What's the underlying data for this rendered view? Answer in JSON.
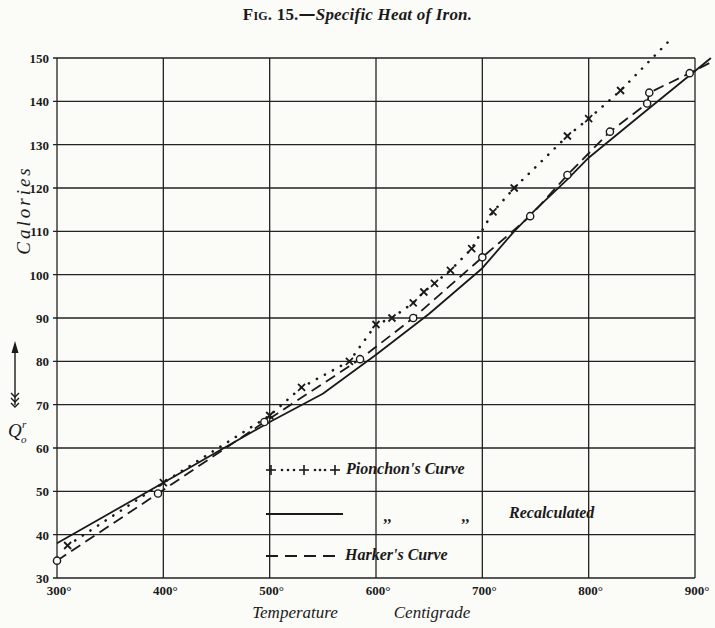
{
  "figure": {
    "label": "Fig. 15.",
    "caption": "Specific Heat of Iron.",
    "dash": "—"
  },
  "axes": {
    "y_label": "Calories",
    "y_symbol": "Q",
    "y_symbol_sub": "o",
    "y_symbol_sup": "r",
    "x_label_1": "Temperature",
    "x_label_2": "Centigrade",
    "x_ticks": [
      "300°",
      "400°",
      "500°",
      "600°",
      "700°",
      "800°",
      "900°"
    ],
    "y_ticks": [
      "30",
      "40",
      "50",
      "60",
      "70",
      "80",
      "90",
      "100",
      "110",
      "120",
      "130",
      "140",
      "150"
    ]
  },
  "legend": {
    "pionchon": "Pionchon's Curve",
    "ditto_1": ",,",
    "ditto_2": ",,",
    "recalculated": "Recalculated",
    "harker": "Harker's Curve"
  },
  "colors": {
    "ink": "#1a1a1a",
    "paper": "#fbfbf8"
  },
  "chart_data": {
    "type": "line",
    "title": "Fig. 15.—Specific Heat of Iron.",
    "xlabel": "Temperature Centigrade",
    "ylabel": "Calories (Q₀ᵀ)",
    "xlim": [
      300,
      900
    ],
    "ylim": [
      30,
      150
    ],
    "x_ticks": [
      300,
      400,
      500,
      600,
      700,
      800,
      900
    ],
    "y_ticks": [
      30,
      40,
      50,
      60,
      70,
      80,
      90,
      100,
      110,
      120,
      130,
      140,
      150
    ],
    "grid": true,
    "legend_position": "lower right (inside plot)",
    "series": [
      {
        "name": "Pionchon's Curve",
        "style": "dotted with + markers",
        "x": [
          310,
          400,
          500,
          530,
          575,
          600,
          615,
          635,
          645,
          655,
          670,
          690,
          710,
          730,
          780,
          800,
          830,
          880
        ],
        "y": [
          37.5,
          52,
          67.5,
          74,
          80,
          88.5,
          90,
          93.5,
          96,
          98,
          101,
          106,
          114.5,
          120,
          132,
          136,
          142.5,
          155
        ]
      },
      {
        "name": "Pionchon's Curve Recalculated",
        "style": "solid",
        "x": [
          300,
          350,
          400,
          450,
          500,
          550,
          600,
          650,
          700,
          730,
          750,
          780,
          800,
          850,
          900,
          915
        ],
        "y": [
          38,
          45,
          52,
          59,
          66,
          72.5,
          81.5,
          91,
          101.5,
          110,
          115,
          122,
          127,
          137,
          147,
          150
        ]
      },
      {
        "name": "Harker's Curve",
        "style": "dashed with o markers",
        "x": [
          300,
          395,
          495,
          585,
          635,
          700,
          745,
          780,
          820,
          855,
          857,
          895,
          915
        ],
        "y": [
          34,
          49.5,
          66,
          80.5,
          90,
          104,
          113.5,
          123,
          133,
          139.5,
          142,
          146.5,
          149
        ]
      }
    ]
  }
}
